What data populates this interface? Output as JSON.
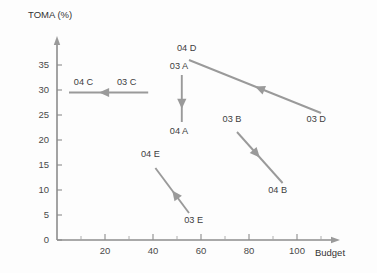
{
  "chart_data": {
    "type": "scatter",
    "title": "",
    "xlabel": "Budget",
    "ylabel": "TOMA (%)",
    "xlim": [
      0,
      115
    ],
    "ylim": [
      0,
      39
    ],
    "grid": false,
    "legend": "none",
    "xticks": [
      20,
      40,
      60,
      80,
      100
    ],
    "yticks": [
      0,
      5,
      10,
      15,
      20,
      25,
      30,
      35
    ],
    "x_minor_tick_step": 10,
    "annotation": "Each arrow links a brand's 2003 position to its 2004 position; arrowhead marks the 2004 end.",
    "series": [
      {
        "name": "A",
        "start_label": "03 A",
        "end_label": "04 A",
        "start": [
          52,
          33.0
        ],
        "end": [
          52,
          23.6
        ],
        "direction": "down"
      },
      {
        "name": "B",
        "start_label": "03 B",
        "end_label": "04 B",
        "start": [
          75,
          21.6
        ],
        "end": [
          94,
          11.4
        ],
        "direction": "down-right"
      },
      {
        "name": "C",
        "start_label": "03 C",
        "end_label": "04 C",
        "start": [
          38,
          29.5
        ],
        "end": [
          5,
          29.5
        ],
        "direction": "left"
      },
      {
        "name": "D",
        "start_label": "03 D",
        "end_label": "04 D",
        "start": [
          110,
          25.4
        ],
        "end": [
          55,
          36.0
        ],
        "direction": "up-left"
      },
      {
        "name": "E",
        "start_label": "03 E",
        "end_label": "04 E",
        "start": [
          55,
          5.4
        ],
        "end": [
          41,
          14.4
        ],
        "direction": "up-left"
      }
    ],
    "labels": [
      {
        "text": "04 D",
        "x": 50,
        "y": 37.8,
        "anchor": "start"
      },
      {
        "text": "03 A",
        "x": 47,
        "y": 34.2,
        "anchor": "start"
      },
      {
        "text": "04 A",
        "x": 47,
        "y": 21.2,
        "anchor": "start"
      },
      {
        "text": "04 C",
        "x": 7,
        "y": 31.0,
        "anchor": "start"
      },
      {
        "text": "03 C",
        "x": 25,
        "y": 31.0,
        "anchor": "start"
      },
      {
        "text": "03 B",
        "x": 69,
        "y": 23.6,
        "anchor": "start"
      },
      {
        "text": "04 B",
        "x": 88,
        "y": 9.4,
        "anchor": "start"
      },
      {
        "text": "03 D",
        "x": 104,
        "y": 23.6,
        "anchor": "start"
      },
      {
        "text": "04 E",
        "x": 35,
        "y": 16.6,
        "anchor": "start"
      },
      {
        "text": "03 E",
        "x": 53,
        "y": 3.4,
        "anchor": "start"
      }
    ],
    "colors": {
      "background": "#fdfdfd",
      "axis": "#8c8c8c",
      "arrow": "#9a9a9a",
      "text": "#3d3d3d",
      "ticklabel": "#4a4a4a"
    }
  }
}
